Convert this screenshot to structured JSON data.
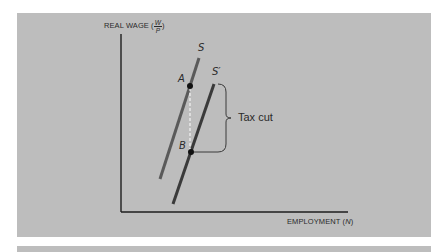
{
  "figure": {
    "y_axis_label": "REAL WAGE",
    "y_axis_fraction": {
      "numerator": "W",
      "denominator": "P"
    },
    "x_axis_label": "EMPLOYMENT",
    "x_axis_symbol": "N",
    "curves": [
      {
        "name": "S",
        "label": "S",
        "color": "#5a5a5a"
      },
      {
        "name": "S-prime",
        "label": "S′",
        "color": "#3a3a3a"
      }
    ],
    "points": [
      {
        "label": "A",
        "on": "S"
      },
      {
        "label": "B",
        "on": "S′"
      }
    ],
    "annotation": "Tax cut",
    "colors": {
      "panel": "#bdbdbd",
      "axis": "#1e1e1e",
      "dashed": "#ffffff"
    }
  }
}
